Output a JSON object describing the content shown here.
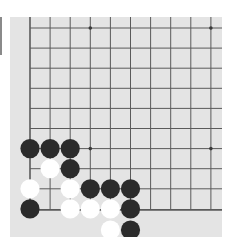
{
  "board": {
    "background": "#e4e4e4",
    "line_color": "#5a5a5a",
    "origin_x": 20,
    "origin_y": 11,
    "spacing": 20.1,
    "cols_visible": 10,
    "rows_visible": 10,
    "left_edge": true,
    "bottom_edge": true,
    "star_points": [
      [
        3,
        0
      ],
      [
        9,
        0
      ],
      [
        3,
        6
      ],
      [
        9,
        6
      ]
    ]
  },
  "stones": [
    {
      "color": "black",
      "col": 0,
      "row": 5
    },
    {
      "color": "black",
      "col": 1,
      "row": 5
    },
    {
      "color": "black",
      "col": 2,
      "row": 5
    },
    {
      "color": "white",
      "col": 1,
      "row": 6
    },
    {
      "color": "black",
      "col": 2,
      "row": 6
    },
    {
      "color": "white",
      "col": 0,
      "row": 7
    },
    {
      "color": "white",
      "col": 2,
      "row": 7
    },
    {
      "color": "black",
      "col": 3,
      "row": 7
    },
    {
      "color": "black",
      "col": 4,
      "row": 7
    },
    {
      "color": "black",
      "col": 5,
      "row": 7
    },
    {
      "color": "black",
      "col": 0,
      "row": 8
    },
    {
      "color": "white",
      "col": 2,
      "row": 8
    },
    {
      "color": "white",
      "col": 3,
      "row": 8
    },
    {
      "color": "white",
      "col": 4,
      "row": 8
    },
    {
      "color": "black",
      "col": 5,
      "row": 8
    },
    {
      "color": "white",
      "col": 4,
      "row": 9
    },
    {
      "color": "black",
      "col": 5,
      "row": 9
    }
  ],
  "colors": {
    "black_stone": "#2b2b2b",
    "white_stone": "#ffffff"
  }
}
